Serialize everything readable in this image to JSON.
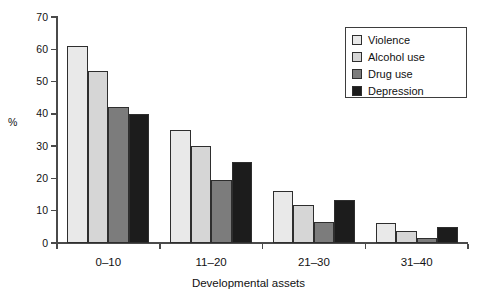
{
  "chart_data": {
    "type": "bar",
    "title": "",
    "xlabel": "Developmental assets",
    "ylabel": "%",
    "categories": [
      "0–10",
      "11–20",
      "21–30",
      "31–40"
    ],
    "series": [
      {
        "name": "Violence",
        "color": "#e9e9e9",
        "values": [
          61,
          35,
          16.2,
          6.3
        ]
      },
      {
        "name": "Alcohol use",
        "color": "#d6d6d6",
        "values": [
          53.2,
          30.1,
          11.7,
          3.6
        ]
      },
      {
        "name": "Drug use",
        "color": "#7c7c7c",
        "values": [
          42,
          19.4,
          6.4,
          1.5
        ]
      },
      {
        "name": "Depression",
        "color": "#1c1c1c",
        "values": [
          40,
          25.2,
          13.2,
          5.1
        ]
      }
    ],
    "ylim": [
      0,
      70
    ],
    "yticks": [
      0,
      10,
      20,
      30,
      40,
      50,
      60,
      70
    ],
    "ytick_labels": [
      "0",
      "10",
      "20",
      "30",
      "40",
      "50",
      "60",
      "70"
    ],
    "grid": false,
    "legend_position": "top-right",
    "bar_border_color": "#2e2e2e",
    "axis_color": "#4a4a4a"
  },
  "legend": {
    "items": [
      {
        "label": "Violence"
      },
      {
        "label": "Alcohol use"
      },
      {
        "label": "Drug use"
      },
      {
        "label": "Depression"
      }
    ]
  }
}
